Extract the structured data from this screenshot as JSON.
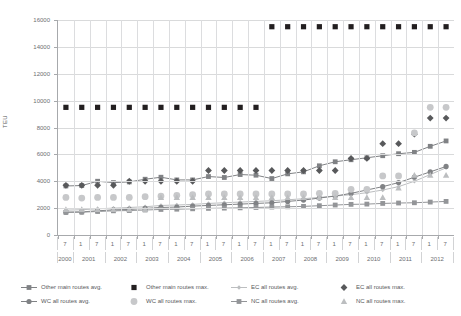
{
  "chart_data": {
    "type": "line",
    "title": "",
    "xlabel": "",
    "ylabel": "TEU",
    "ylim": [
      0,
      16000
    ],
    "ytick_step": 2000,
    "yticks": [
      "0",
      "2000",
      "4000",
      "6000",
      "8000",
      "10000",
      "12000",
      "14000",
      "16000"
    ],
    "grid": true,
    "legend_position": "bottom",
    "x_months": [
      "7",
      "1",
      "7",
      "1",
      "7",
      "1",
      "7",
      "1",
      "7",
      "1",
      "7",
      "1",
      "7",
      "1",
      "7",
      "1",
      "7",
      "1",
      "7",
      "1",
      "7",
      "1",
      "7",
      "1",
      "7"
    ],
    "x_years": [
      "2000",
      "2001",
      "2002",
      "2003",
      "2004",
      "2005",
      "2006",
      "2007",
      "2008",
      "2009",
      "2010",
      "2011",
      "2012"
    ],
    "categories": [
      "2000-7",
      "2001-1",
      "2001-7",
      "2002-1",
      "2002-7",
      "2003-1",
      "2003-7",
      "2004-1",
      "2004-7",
      "2005-1",
      "2005-7",
      "2006-1",
      "2006-7",
      "2007-1",
      "2007-7",
      "2008-1",
      "2008-7",
      "2009-1",
      "2009-7",
      "2010-1",
      "2010-7",
      "2011-1",
      "2011-7",
      "2012-1",
      "2012-7"
    ],
    "series": [
      {
        "name": "Other main routes avg.",
        "marker": "square",
        "line": true,
        "color": "#808285",
        "values": [
          3650,
          3680,
          4000,
          3900,
          3950,
          4150,
          4300,
          4100,
          4100,
          4350,
          4280,
          4500,
          4450,
          4200,
          4550,
          4700,
          5150,
          5450,
          5600,
          5750,
          5900,
          6050,
          6150,
          6600,
          7000
        ]
      },
      {
        "name": "Other main routes max.",
        "marker": "square-filled",
        "line": false,
        "color": "#231f20",
        "values": [
          9500,
          9500,
          9500,
          9500,
          9500,
          9500,
          9500,
          9500,
          9500,
          9500,
          9500,
          9500,
          9500,
          15500,
          15500,
          15500,
          15500,
          15500,
          15500,
          15500,
          15500,
          15500,
          15500,
          15500,
          15500
        ]
      },
      {
        "name": "EC all routes avg.",
        "marker": "small-diamond",
        "line": true,
        "color": "#bcbec0",
        "values": [
          1850,
          1880,
          1950,
          2000,
          2050,
          2100,
          2200,
          2230,
          2280,
          2350,
          2400,
          2450,
          2500,
          2550,
          2620,
          2700,
          2800,
          2900,
          3000,
          3150,
          3350,
          3600,
          4000,
          4500,
          5000
        ]
      },
      {
        "name": "EC all routes max.",
        "marker": "diamond",
        "line": false,
        "color": "#58595b",
        "values": [
          3700,
          3700,
          3700,
          3700,
          4000,
          4000,
          4000,
          4000,
          4000,
          4800,
          4800,
          4800,
          4800,
          4800,
          4800,
          4800,
          4800,
          4800,
          5700,
          5700,
          6800,
          6800,
          7500,
          8700,
          8700
        ]
      },
      {
        "name": "WC all routes avg.",
        "marker": "circle-line",
        "line": true,
        "color": "#808285",
        "values": [
          1700,
          1720,
          1800,
          1870,
          1900,
          1980,
          2050,
          2080,
          2150,
          2200,
          2250,
          2300,
          2350,
          2400,
          2500,
          2600,
          2750,
          2900,
          3100,
          3350,
          3600,
          3900,
          4300,
          4700,
          5100
        ]
      },
      {
        "name": "WC all routes max.",
        "marker": "circle",
        "line": false,
        "color": "#c7c8ca",
        "values": [
          2800,
          2750,
          2800,
          2800,
          2800,
          2850,
          2900,
          2950,
          3000,
          3050,
          3050,
          3050,
          3050,
          3050,
          3050,
          3050,
          3100,
          3100,
          3400,
          3400,
          4400,
          4400,
          7600,
          9500,
          9500
        ]
      },
      {
        "name": "NC all routes avg.",
        "marker": "square-line",
        "line": true,
        "color": "#939598",
        "values": [
          1680,
          1700,
          1750,
          1800,
          1820,
          1860,
          1900,
          1920,
          1950,
          1980,
          2000,
          2020,
          2050,
          2080,
          2100,
          2130,
          2180,
          2230,
          2280,
          2300,
          2350,
          2380,
          2400,
          2450,
          2500
        ]
      },
      {
        "name": "NC all routes max.",
        "marker": "triangle",
        "line": false,
        "color": "#bcbec0",
        "values": [
          1900,
          1900,
          1900,
          1900,
          1900,
          1900,
          2800,
          2800,
          2800,
          2800,
          2800,
          2800,
          2800,
          2800,
          2800,
          2800,
          2800,
          2800,
          2800,
          2800,
          2800,
          3500,
          4450,
          4450,
          4450
        ]
      }
    ]
  },
  "legend": {
    "items": [
      {
        "label": "Other main routes avg.",
        "marker": "square",
        "line": true,
        "color": "#808285"
      },
      {
        "label": "Other main routes max.",
        "marker": "square-filled",
        "line": false,
        "color": "#231f20"
      },
      {
        "label": "EC all routes avg.",
        "marker": "small-diamond",
        "line": true,
        "color": "#bcbec0"
      },
      {
        "label": "EC all routes max.",
        "marker": "diamond",
        "line": false,
        "color": "#58595b"
      },
      {
        "label": "WC all routes avg.",
        "marker": "circle-line",
        "line": true,
        "color": "#808285"
      },
      {
        "label": "WC all routes max.",
        "marker": "circle",
        "line": false,
        "color": "#c7c8ca"
      },
      {
        "label": "NC all routes avg.",
        "marker": "square-line",
        "line": true,
        "color": "#939598"
      },
      {
        "label": "NC all routes max.",
        "marker": "triangle",
        "line": false,
        "color": "#bcbec0"
      }
    ]
  },
  "colors": {
    "axis": "#a7a9ac",
    "grid": "#d9dadb",
    "text": "#58595b",
    "background": "#ffffff"
  }
}
